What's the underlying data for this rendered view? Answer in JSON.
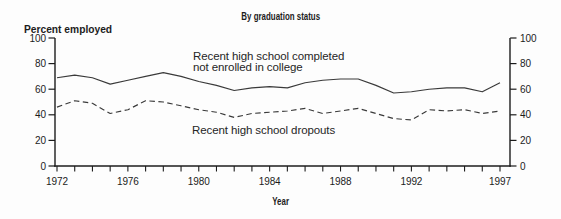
{
  "chart_data": {
    "type": "line",
    "title": "By graduation status",
    "xlabel": "Year",
    "ylabel": "Percent employed",
    "x": [
      1972,
      1973,
      1974,
      1975,
      1976,
      1977,
      1978,
      1979,
      1980,
      1981,
      1982,
      1983,
      1984,
      1985,
      1986,
      1987,
      1988,
      1989,
      1990,
      1991,
      1992,
      1993,
      1994,
      1995,
      1996,
      1997
    ],
    "x_tick_labels": [
      "1972",
      "1976",
      "1980",
      "1984",
      "1988",
      "1992",
      "1997"
    ],
    "y_ticks": [
      0,
      20,
      40,
      60,
      80,
      100
    ],
    "ylim": [
      0,
      100
    ],
    "grid": false,
    "dual_y_axis": true,
    "legend_position": "inline-annotations",
    "series": [
      {
        "slug": "completers",
        "name": "Recent high school completed not enrolled in college",
        "line_style": "solid",
        "values": [
          69,
          71,
          69,
          64,
          67,
          70,
          73,
          70,
          66,
          63,
          59,
          61,
          62,
          61,
          65,
          67,
          68,
          68,
          63,
          57,
          58,
          60,
          61,
          61,
          58,
          65
        ]
      },
      {
        "slug": "dropouts",
        "name": "Recent high school dropouts",
        "line_style": "dashed",
        "values": [
          46,
          51,
          49,
          41,
          44,
          51,
          50,
          47,
          44,
          42,
          38,
          41,
          42,
          43,
          45,
          41,
          43,
          45,
          41,
          37,
          36,
          44,
          43,
          44,
          41,
          43
        ]
      }
    ],
    "annotations": [
      {
        "lines": [
          "Recent high school completed",
          "not enrolled in college"
        ]
      },
      {
        "lines": [
          "Recent high school dropouts"
        ]
      }
    ]
  },
  "colors": {
    "background": "#fdfdfd",
    "axis": "#1c1c1c",
    "line": "#3a3a3a",
    "text": "#1c1c1c"
  }
}
